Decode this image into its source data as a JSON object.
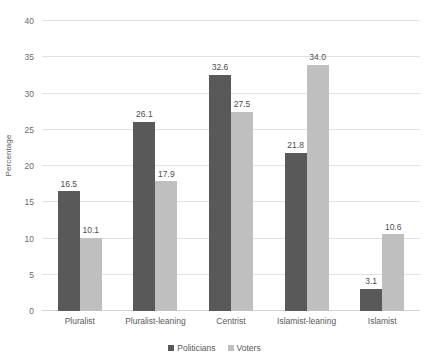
{
  "chart_data": {
    "type": "bar",
    "title": "",
    "xlabel": "",
    "ylabel": "Percentage",
    "ylim": [
      0,
      40
    ],
    "ytick_step": 5,
    "yticks": [
      0,
      5,
      10,
      15,
      20,
      25,
      30,
      35,
      40
    ],
    "ytick_labels": [
      "0",
      "5",
      "10",
      "15",
      "20",
      "25",
      "30",
      "35",
      "40"
    ],
    "grid": "horizontal",
    "legend_position": "bottom",
    "categories": [
      "Pluralist",
      "Pluralist-leaning",
      "Centrist",
      "Islamist-leaning",
      "Islamist"
    ],
    "series": [
      {
        "name": "Politicians",
        "color": "#595959",
        "values": [
          16.5,
          26.1,
          32.6,
          21.8,
          3.1
        ],
        "value_labels": [
          "16.5",
          "26.1",
          "32.6",
          "21.8",
          "3.1"
        ]
      },
      {
        "name": "Voters",
        "color": "#bfbfbf",
        "values": [
          10.1,
          17.9,
          27.5,
          34.0,
          10.6
        ],
        "value_labels": [
          "10.1",
          "17.9",
          "27.5",
          "34.0",
          "10.6"
        ]
      }
    ]
  },
  "legend": {
    "items": [
      {
        "label": "Politicians",
        "color": "#595959"
      },
      {
        "label": "Voters",
        "color": "#bfbfbf"
      }
    ]
  },
  "axes": {
    "y_title": "Percentage"
  }
}
